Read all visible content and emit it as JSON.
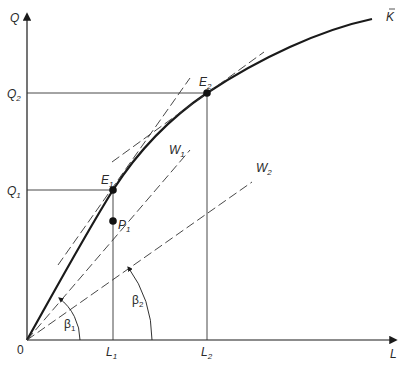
{
  "diagram": {
    "type": "production-function",
    "axes": {
      "y_label": "Q",
      "x_label": "L",
      "origin_label": "0"
    },
    "curve": {
      "label": "K",
      "label_mark": "bar"
    },
    "y_ticks": [
      {
        "base": "Q",
        "sub": "2"
      },
      {
        "base": "Q",
        "sub": "1"
      }
    ],
    "x_ticks": [
      {
        "base": "L",
        "sub": "1"
      },
      {
        "base": "L",
        "sub": "2"
      }
    ],
    "points": [
      {
        "base": "E",
        "sub": "1"
      },
      {
        "base": "E",
        "sub": "2"
      },
      {
        "base": "P",
        "sub": "1"
      }
    ],
    "rays": [
      {
        "base": "W",
        "sub": "1"
      },
      {
        "base": "W",
        "sub": "2"
      }
    ],
    "angles": [
      {
        "base": "β",
        "sub": "1"
      },
      {
        "base": "β",
        "sub": "2"
      }
    ],
    "colors": {
      "line": "#1a1a1a",
      "thin": "#333333",
      "background": "#ffffff"
    }
  }
}
